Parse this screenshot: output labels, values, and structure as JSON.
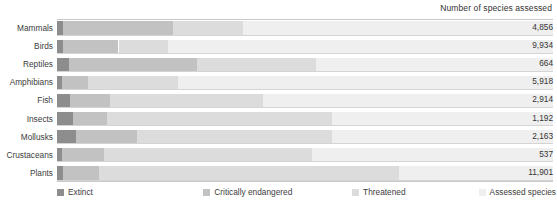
{
  "header": {
    "title": "Number of species assessed"
  },
  "legend": {
    "items": [
      {
        "label": "Extinct",
        "color": "#8d8d8d",
        "left_pct": 0
      },
      {
        "label": "Critically endangered",
        "color": "#c2c2c2",
        "left_pct": 29.5
      },
      {
        "label": "Threatened",
        "color": "#dcdcdc",
        "left_pct": 59.5
      },
      {
        "label": "Assessed species",
        "color": "#efefef",
        "left_pct": 85.0
      }
    ]
  },
  "chart_data": {
    "type": "bar",
    "orientation": "horizontal",
    "stacked": true,
    "normalized": true,
    "title": "Number of species assessed",
    "xlabel": "",
    "ylabel": "",
    "grid": false,
    "legend_position": "bottom",
    "categories": [
      "Mammals",
      "Birds",
      "Reptiles",
      "Amphibians",
      "Fish",
      "Insects",
      "Mollusks",
      "Crustaceans",
      "Plants"
    ],
    "value_labels": [
      "4,856",
      "9,934",
      "664",
      "5,918",
      "2,914",
      "1,192",
      "2,163",
      "537",
      "11,901"
    ],
    "values": [
      4856,
      9934,
      664,
      5918,
      2914,
      1192,
      2163,
      537,
      11901
    ],
    "series": [
      {
        "name": "Extinct",
        "color": "#8d8d8d",
        "widths_pct": [
          1.3,
          1.3,
          2.4,
          1.1,
          2.6,
          3.2,
          3.9,
          1.1,
          1.3
        ]
      },
      {
        "name": "Critically endangered",
        "color": "#c2c2c2",
        "widths_pct": [
          22.1,
          11.1,
          25.8,
          5.2,
          8.1,
          6.9,
          12.2,
          8.3,
          7.2
        ]
      },
      {
        "name": "Threatened",
        "color": "#dcdcdc",
        "widths_pct": [
          14.1,
          9.9,
          24.1,
          18.0,
          30.9,
          45.4,
          39.3,
          42.0,
          60.4
        ]
      },
      {
        "name": "Assessed species",
        "color": "#efefef",
        "widths_pct": [
          62.5,
          77.7,
          47.7,
          75.7,
          58.4,
          44.5,
          44.6,
          48.6,
          31.1
        ]
      }
    ]
  }
}
